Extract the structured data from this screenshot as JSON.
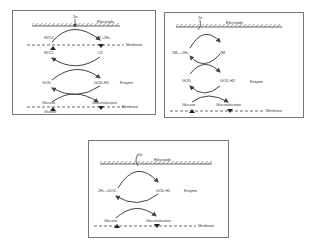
{
  "panels": [
    {
      "id": "first-generation",
      "electron": "2e",
      "electrode": "Electrode",
      "membrane_top": "Membrane",
      "h2o2_top": "H2O2",
      "o2_top": "O2 +2H+",
      "h2o2_bottom": "H2O2",
      "o2_bottom": "O2",
      "god": "GOD",
      "god_h2": "GOD-H2",
      "enzyme": "Enzyme",
      "glucose": "Glucose",
      "gluconolactone": "Gluconolactone",
      "membrane_bottom": "Membrane",
      "glucose_below": "Glucose"
    },
    {
      "id": "second-generation",
      "electron": "2e",
      "electrode": "Electrode",
      "mediator_ox": "2M+ +2H+",
      "mediator_red": "2M",
      "god": "GOD",
      "god_h2": "GOD-H2",
      "enzyme": "Enzyme",
      "glucose": "Glucose",
      "gluconolactone": "Gluconolactone",
      "membrane": "Membrane"
    },
    {
      "id": "third-generation",
      "electron": "2e",
      "electrode": "Electrode",
      "god_ox": "2H+ +GOD",
      "god_h2": "GOD-H2",
      "enzyme": "Enzyme",
      "glucose": "Glucose",
      "gluconolactone": "Gluconolactone",
      "membrane": "Membrane"
    }
  ]
}
